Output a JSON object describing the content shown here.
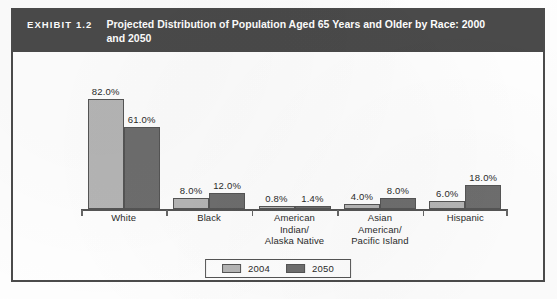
{
  "exhibit": {
    "number": "EXHIBIT 1.2",
    "title": "Projected Distribution of Population Aged 65 Years and Older by Race: 2000 and 2050"
  },
  "colors": {
    "header_band": "#4a4a4a",
    "frame": "#4b4b4b",
    "series_2004": "#b6b6b6",
    "series_2050": "#6e6e6e",
    "axis": "#555555",
    "text": "#2b2b2b"
  },
  "legend": {
    "items": [
      {
        "label": "2004",
        "color": "#b6b6b6"
      },
      {
        "label": "2050",
        "color": "#6e6e6e"
      }
    ]
  },
  "chart_data": {
    "type": "bar",
    "title": "Projected Distribution of Population Aged 65 Years and Older by Race: 2000 and 2050",
    "xlabel": "",
    "ylabel": "",
    "ylim": [
      0,
      90
    ],
    "grid": false,
    "legend_position": "bottom",
    "categories": [
      "White",
      "Black",
      "American Indian/ Alaska Native",
      "Asian American/ Pacific Island",
      "Hispanic"
    ],
    "category_lines": [
      [
        "White"
      ],
      [
        "Black"
      ],
      [
        "American",
        "Indian/",
        "Alaska Native"
      ],
      [
        "Asian",
        "American/",
        "Pacific Island"
      ],
      [
        "Hispanic"
      ]
    ],
    "series": [
      {
        "name": "2004",
        "values": [
          82.0,
          8.0,
          0.8,
          4.0,
          6.0
        ],
        "labels": [
          "82.0%",
          "8.0%",
          "0.8%",
          "4.0%",
          "6.0%"
        ]
      },
      {
        "name": "2050",
        "values": [
          61.0,
          12.0,
          1.4,
          8.0,
          18.0
        ],
        "labels": [
          "61.0%",
          "12.0%",
          "1.4%",
          "8.0%",
          "18.0%"
        ]
      }
    ]
  }
}
